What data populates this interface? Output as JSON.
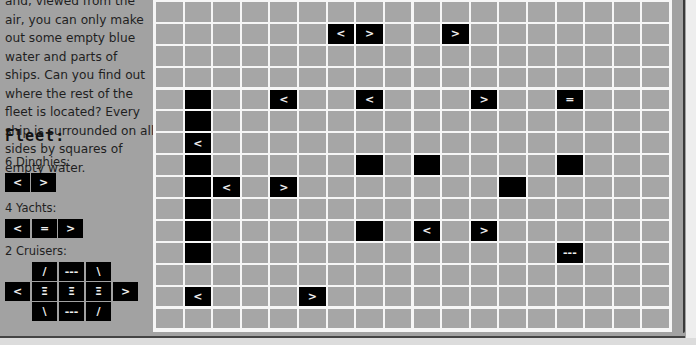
{
  "intro": {
    "text": "and, viewed from the air, you can only make out some empty blue water and parts of ships. Can you find out where the rest of the fleet is located? Every ship is surrounded on all sides by squares of empty water."
  },
  "fleet": {
    "title": "Fleet:",
    "dinghies": {
      "label": "6 Dinghies:",
      "pieces": [
        "<",
        ">"
      ]
    },
    "yachts": {
      "label": "4 Yachts:",
      "pieces": [
        "<",
        "=",
        ">"
      ]
    },
    "cruisers": {
      "label": "2 Cruisers:",
      "top": [
        "/",
        "---",
        "\\"
      ],
      "middle": [
        "<",
        "Ξ",
        "Ξ",
        "Ξ",
        ">"
      ],
      "bottom": [
        "\\",
        "---",
        "/"
      ]
    }
  },
  "grid": {
    "columns": 18,
    "visible_rows": 16,
    "colors": {
      "water": "#a6a6a6",
      "ship": "#000000",
      "line": "#f6f6f6"
    },
    "cells": [
      {
        "r": 0,
        "c": 14,
        "v": ""
      },
      {
        "r": 0,
        "c": 16,
        "v": ""
      },
      {
        "r": 2,
        "c": 6,
        "v": "<"
      },
      {
        "r": 2,
        "c": 7,
        "v": ">"
      },
      {
        "r": 2,
        "c": 10,
        "v": ">"
      },
      {
        "r": 5,
        "c": 1,
        "v": ""
      },
      {
        "r": 5,
        "c": 4,
        "v": "<"
      },
      {
        "r": 5,
        "c": 7,
        "v": "<"
      },
      {
        "r": 5,
        "c": 11,
        "v": ">"
      },
      {
        "r": 5,
        "c": 14,
        "v": "="
      },
      {
        "r": 6,
        "c": 1,
        "v": ""
      },
      {
        "r": 7,
        "c": 1,
        "v": "<"
      },
      {
        "r": 8,
        "c": 1,
        "v": ""
      },
      {
        "r": 8,
        "c": 7,
        "v": ""
      },
      {
        "r": 8,
        "c": 9,
        "v": ""
      },
      {
        "r": 8,
        "c": 14,
        "v": ""
      },
      {
        "r": 9,
        "c": 1,
        "v": ""
      },
      {
        "r": 9,
        "c": 2,
        "v": "<"
      },
      {
        "r": 9,
        "c": 4,
        "v": ">"
      },
      {
        "r": 9,
        "c": 12,
        "v": ""
      },
      {
        "r": 10,
        "c": 1,
        "v": ""
      },
      {
        "r": 11,
        "c": 1,
        "v": ""
      },
      {
        "r": 11,
        "c": 7,
        "v": ""
      },
      {
        "r": 11,
        "c": 9,
        "v": "<"
      },
      {
        "r": 11,
        "c": 11,
        "v": ">"
      },
      {
        "r": 12,
        "c": 1,
        "v": ""
      },
      {
        "r": 12,
        "c": 14,
        "v": "---"
      },
      {
        "r": 14,
        "c": 1,
        "v": "<"
      },
      {
        "r": 14,
        "c": 5,
        "v": ">"
      }
    ]
  }
}
